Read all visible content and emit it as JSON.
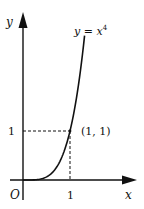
{
  "chart_data": {
    "type": "line",
    "title": "",
    "xlabel": "x",
    "ylabel": "y",
    "origin_label": "O",
    "curve_label": "y = x",
    "curve_label_exponent": "4",
    "function": "x^4",
    "x_range": [
      0,
      1.31
    ],
    "xlim": [
      -0.35,
      2.45
    ],
    "ylim": [
      -0.5,
      3.5
    ],
    "x_ticks": [
      {
        "value": 1,
        "label": "1"
      }
    ],
    "y_ticks": [
      {
        "value": 1,
        "label": "1"
      }
    ],
    "points": [
      {
        "x": 1,
        "y": 1,
        "label": "(1, 1)"
      }
    ],
    "series": [
      {
        "name": "y = x^4",
        "x": [
          0,
          0.2,
          0.4,
          0.6,
          0.8,
          1.0,
          1.1,
          1.2,
          1.31
        ],
        "values": [
          0,
          0.0016,
          0.0256,
          0.1296,
          0.4096,
          1,
          1.4641,
          2.0736,
          2.945
        ]
      }
    ],
    "grid": false,
    "legend": "none",
    "annotations": [
      "dashed guide lines from (1,1) to both axes"
    ]
  }
}
